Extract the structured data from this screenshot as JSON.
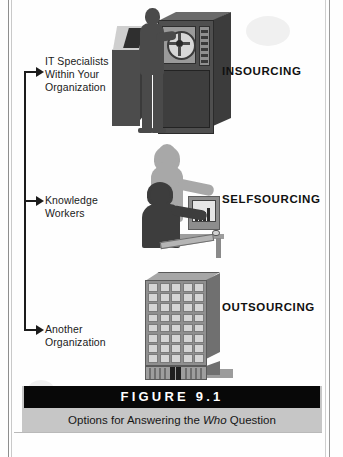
{
  "figure": {
    "number_label": "FIGURE 9.1",
    "caption_before": "Options for Answering the ",
    "caption_emphasis": "Who",
    "caption_after": " Question"
  },
  "rows": [
    {
      "id": "insourcing",
      "label_lines": [
        "IT Specialists",
        "Within Your",
        "Organization"
      ],
      "heading": "INSOURCING",
      "illustration": "mainframe-with-it-specialist"
    },
    {
      "id": "selfsourcing",
      "label_lines": [
        "Knowledge",
        "Workers"
      ],
      "heading": "SELFSOURCING",
      "illustration": "knowledge-worker-at-desktop-computer"
    },
    {
      "id": "outsourcing",
      "label_lines": [
        "Another",
        "Organization"
      ],
      "heading": "OUTSOURCING",
      "illustration": "office-building"
    }
  ],
  "colors": {
    "caption_bar": "#080808",
    "caption_band": "#c6c6c6",
    "ink": "#1a1a1a",
    "art_dark": "#4a4a4a",
    "art_mid": "#8f8f8f",
    "art_light": "#d5d5d5"
  },
  "icons": {
    "arrow": "arrow-right-icon",
    "bracket": "bracket-spine"
  }
}
